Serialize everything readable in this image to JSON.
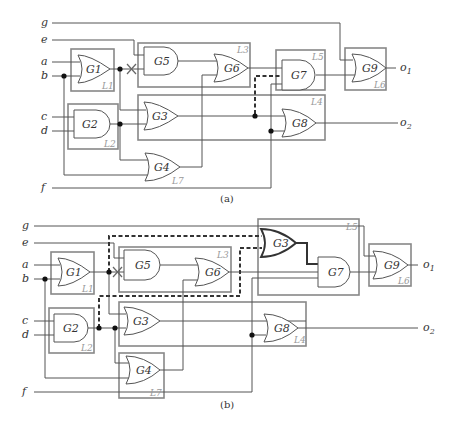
{
  "figure_a": {
    "caption": "(a)",
    "inputs": [
      "g",
      "e",
      "a",
      "b",
      "c",
      "d",
      "f"
    ],
    "outputs": [
      "o1",
      "o2"
    ],
    "gates": {
      "G1": "G1",
      "G2": "G2",
      "G3": "G3",
      "G4": "G4",
      "G5": "G5",
      "G6": "G6",
      "G7": "G7",
      "G8": "G8",
      "G9": "G9"
    },
    "levels": {
      "L1": "L1",
      "L2": "L2",
      "L3": "L3",
      "L4": "L4",
      "L5": "L5",
      "L6": "L6",
      "L7": "L7"
    }
  },
  "figure_b": {
    "caption": "(b)",
    "inputs": [
      "g",
      "e",
      "a",
      "b",
      "c",
      "d",
      "f"
    ],
    "outputs": [
      "o1",
      "o2"
    ],
    "gates": {
      "G1": "G1",
      "G2": "G2",
      "G3": "G3",
      "G3b": "G3",
      "G4": "G4",
      "G5": "G5",
      "G6": "G6",
      "G7": "G7",
      "G8": "G8",
      "G9": "G9"
    },
    "levels": {
      "L1": "L1",
      "L2": "L2",
      "L3": "L3",
      "L4": "L4",
      "L5": "L5",
      "L6": "L6",
      "L7": "L7"
    }
  },
  "labels": {
    "g": "g",
    "e": "e",
    "a": "a",
    "b": "b",
    "c": "c",
    "d": "d",
    "f": "f",
    "o1": "o",
    "o1_sub": "1",
    "o2": "o",
    "o2_sub": "2"
  }
}
